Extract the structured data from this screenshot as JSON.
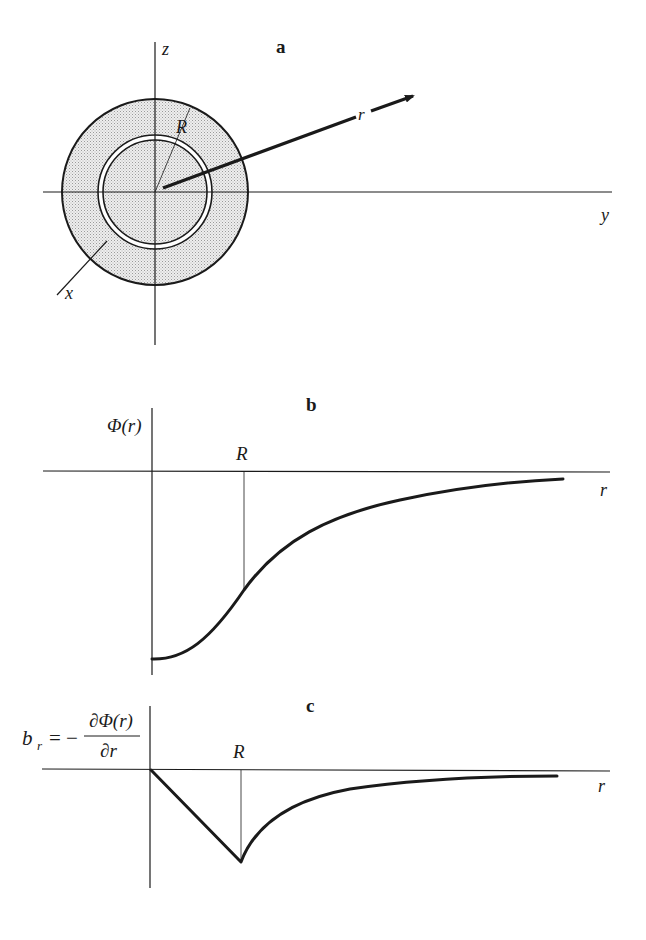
{
  "panels": {
    "a": {
      "label": "a",
      "axis_z": "z",
      "axis_y": "y",
      "axis_x": "x",
      "radius_label": "R",
      "vector_label": "r"
    },
    "b": {
      "label": "b",
      "ylabel": "Φ(r)",
      "xlabel": "r",
      "marker_label": "R"
    },
    "c": {
      "label": "c",
      "ylabel_lhs": "b",
      "ylabel_sub": "r",
      "ylabel_eq": "= −",
      "ylabel_num": "∂Φ(r)",
      "ylabel_den": "∂r",
      "xlabel": "r",
      "marker_label": "R"
    }
  },
  "colors": {
    "line": "#1a1a1a",
    "shading": "#d9d9d9"
  }
}
